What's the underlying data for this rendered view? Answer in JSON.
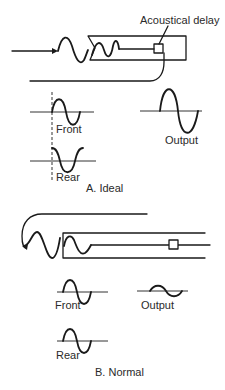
{
  "figure": {
    "panel_a": {
      "caption": "A. Ideal",
      "callout": "Acoustical delay",
      "labels": {
        "front": "Front",
        "rear": "Rear",
        "output": "Output"
      }
    },
    "panel_b": {
      "caption": "B. Normal",
      "labels": {
        "front": "Front",
        "rear": "Rear",
        "output": "Output"
      }
    },
    "colors": {
      "ink": "#1a1a1a",
      "background": "#ffffff"
    }
  }
}
